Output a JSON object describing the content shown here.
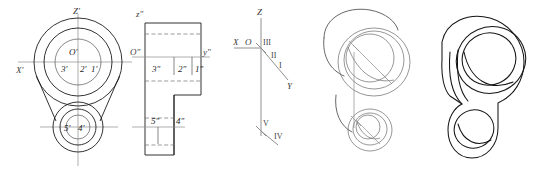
{
  "figure": {
    "panels": [
      {
        "id": "front-view",
        "name": "front-projection-circles"
      },
      {
        "id": "side-view",
        "name": "side-projection-outline"
      },
      {
        "id": "axis-diagram",
        "name": "coordinate-axes-octants"
      },
      {
        "id": "sketch-view",
        "name": "construction-sketch"
      },
      {
        "id": "iso-view",
        "name": "isometric-solid"
      }
    ]
  },
  "front_view": {
    "axis_z_label": "Z'",
    "axis_x_label": "X'",
    "origin_label": "O'",
    "point_3": "3'",
    "point_2": "2'",
    "point_1": "1'",
    "point_5": "5'",
    "point_4": "4'"
  },
  "side_view": {
    "axis_z_label": "z\"",
    "axis_y_label": "y\"",
    "origin_label": "O\"",
    "point_3": "3\"",
    "point_2": "2\"",
    "point_1": "1\"",
    "point_5": "5\"",
    "point_4": "4\""
  },
  "axis_diagram": {
    "axis_z_label": "Z",
    "axis_x_label": "X",
    "origin_label": "O",
    "axis_y_label": "Y",
    "octant_1": "I",
    "octant_2": "II",
    "octant_3": "III",
    "octant_4": "IV",
    "octant_5": "V"
  },
  "colors": {
    "outline": "#1c1c1c",
    "centerline": "#8d8d8d",
    "hidden": "#6e6e6e",
    "axis": "#909090",
    "sketch": "#4a4a4a",
    "label": "#3b3b3b",
    "background": "#ffffff"
  }
}
